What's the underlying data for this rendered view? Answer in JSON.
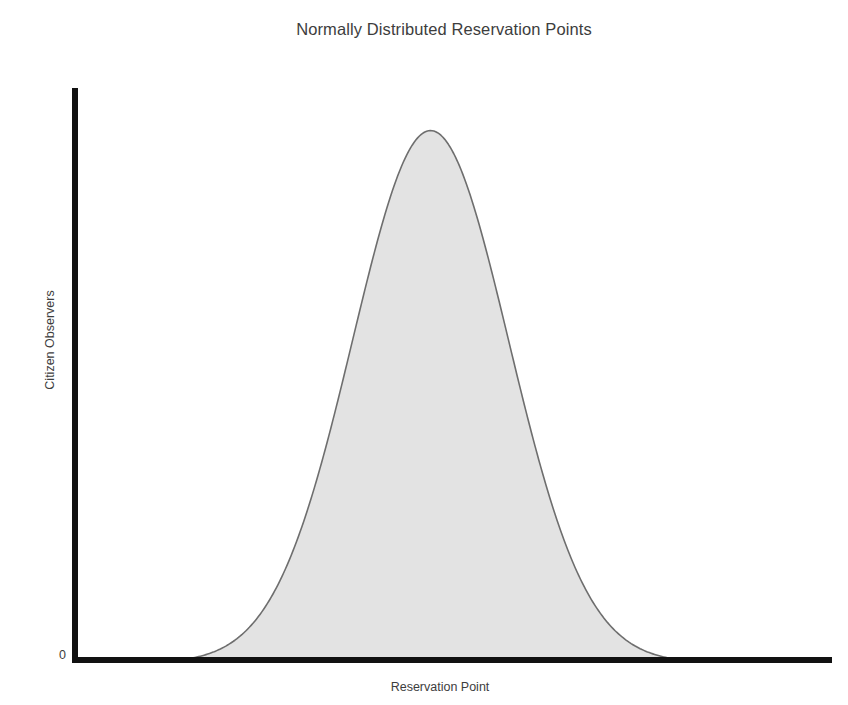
{
  "chart_data": {
    "type": "area",
    "title": "Normally Distributed Reservation Points",
    "xlabel": "Reservation Point",
    "ylabel": "Citizen Observers",
    "grid": false,
    "legend": null,
    "axis_ticks": {
      "y": [
        "0"
      ],
      "x": []
    },
    "distribution": {
      "shape": "normal",
      "mean": 0,
      "std_dev": 1,
      "peak_value": 1.0,
      "baseline_value": 0.0
    },
    "xlim": [
      -4.6,
      5.15
    ],
    "ylim": [
      0,
      1.08
    ],
    "series": [
      {
        "name": "Citizen Observers",
        "fill_color": "#e3e3e3",
        "line_color": "#6e6e6e",
        "x": [
          -4.6,
          -4.3,
          -4.0,
          -3.7,
          -3.4,
          -3.1,
          -2.8,
          -2.5,
          -2.2,
          -1.9,
          -1.6,
          -1.3,
          -1.0,
          -0.7,
          -0.4,
          -0.1,
          0.0,
          0.1,
          0.4,
          0.7,
          1.0,
          1.3,
          1.6,
          1.9,
          2.2,
          2.5,
          2.8,
          3.1,
          3.4,
          3.7,
          4.0,
          4.3,
          4.6,
          5.15
        ],
        "values": [
          0.0,
          0.0001,
          0.0003,
          0.0012,
          0.0034,
          0.0084,
          0.0198,
          0.0439,
          0.0889,
          0.1645,
          0.278,
          0.4296,
          0.6065,
          0.7827,
          0.9231,
          0.995,
          1.0,
          0.995,
          0.9231,
          0.7827,
          0.6065,
          0.4296,
          0.278,
          0.1645,
          0.0889,
          0.0439,
          0.0198,
          0.0084,
          0.0034,
          0.0012,
          0.0003,
          0.0001,
          0.0,
          0.0
        ]
      }
    ]
  },
  "figure": {
    "title": "Normally Distributed Reservation Points",
    "x_axis_label": "Reservation Point",
    "y_axis_label": "Citizen Observers",
    "y_origin_tick": "0",
    "colors": {
      "axis": "#111111",
      "curve_fill": "#e3e3e3",
      "curve_stroke": "#6e6e6e",
      "text": "#3d3d3d",
      "background": "#ffffff"
    }
  }
}
